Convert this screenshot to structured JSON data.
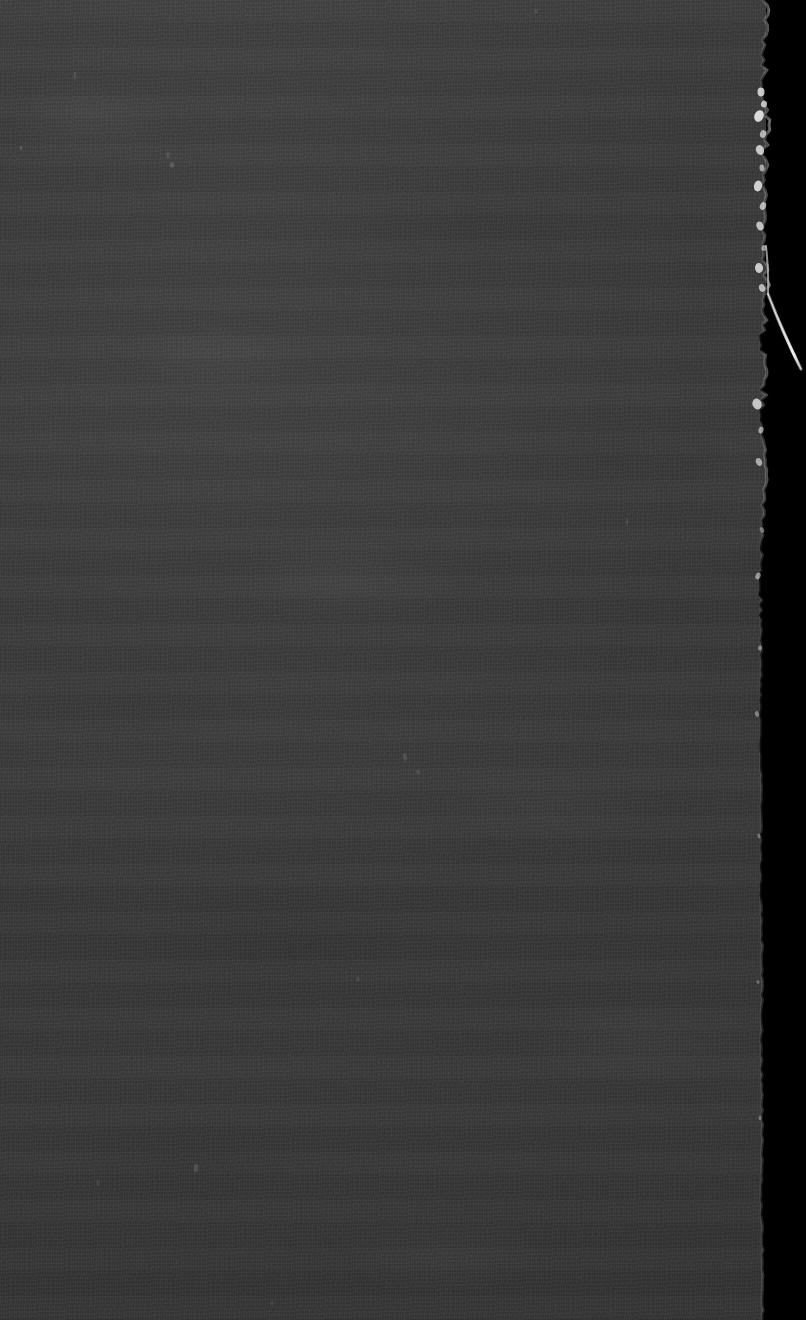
{
  "image": {
    "domain": "Natural-Image",
    "subject": "torn-fibrous-edge-macro",
    "description": "Extreme close-up macro photograph of a dark gray fibrous sheet material (paper or board) whose right-hand torn edge is silhouetted against a black background. A single pale fiber strand protrudes diagonally out from the edge near the upper third of the frame.",
    "width_px": 806,
    "height_px": 1320,
    "orientation": "portrait",
    "lighting": "low-key, flat frontal illumination; edge highlights only",
    "focus": "shallow, edge in focus",
    "text_present": "none"
  },
  "colors": {
    "background_black": "#000000",
    "material_gray": "#3a3a3a",
    "material_gray_light": "#3d3d3d",
    "material_gray_dark": "#373737",
    "edge_highlight": "#b9b9b9",
    "fiber_bright": "#e8e8e8",
    "fiber_mid": "#9a9a9a",
    "fleck_white": "#f0f0f0"
  },
  "regions": [
    {
      "name": "material-slab",
      "role": "primary subject",
      "bounds": {
        "x": 0,
        "y": 0,
        "width": 766,
        "height": 1320
      },
      "tone": "#3a3a3a",
      "texture": "fine fibrous grain with faint horizontal scanline banding and soft mottling"
    },
    {
      "name": "black-background",
      "role": "negative space",
      "bounds": {
        "x": 760,
        "y": 0,
        "width": 46,
        "height": 1320
      },
      "tone": "#000000"
    },
    {
      "name": "torn-edge",
      "role": "boundary",
      "approx_x_top": 765,
      "approx_x_middle": 760,
      "approx_x_bottom": 762,
      "character": "ragged, flecked with bright fiber tufts in the upper third; becomes clean and nearly straight below y=600"
    },
    {
      "name": "protruding-fiber",
      "role": "detail",
      "origin": {
        "x": 768,
        "y": 294
      },
      "tip": {
        "x": 801,
        "y": 369
      },
      "description": "single pale tapered fiber angling down and to the right, brightest near its tip"
    },
    {
      "name": "edge-fleck-cluster",
      "role": "detail",
      "bounds": {
        "x": 758,
        "y": 86,
        "width": 16,
        "height": 120
      },
      "description": "cluster of bright irregular fiber tufts along the edge"
    }
  ],
  "edge_profile": {
    "note": "x position of the material/background boundary sampled down the frame",
    "points": [
      {
        "y": 0,
        "x": 766
      },
      {
        "y": 40,
        "x": 765
      },
      {
        "y": 90,
        "x": 763
      },
      {
        "y": 120,
        "x": 768
      },
      {
        "y": 150,
        "x": 764
      },
      {
        "y": 200,
        "x": 766
      },
      {
        "y": 240,
        "x": 763
      },
      {
        "y": 280,
        "x": 767
      },
      {
        "y": 300,
        "x": 765
      },
      {
        "y": 340,
        "x": 762
      },
      {
        "y": 380,
        "x": 764
      },
      {
        "y": 420,
        "x": 761
      },
      {
        "y": 470,
        "x": 766
      },
      {
        "y": 520,
        "x": 762
      },
      {
        "y": 580,
        "x": 760
      },
      {
        "y": 650,
        "x": 761
      },
      {
        "y": 720,
        "x": 760
      },
      {
        "y": 800,
        "x": 761
      },
      {
        "y": 880,
        "x": 760
      },
      {
        "y": 960,
        "x": 762
      },
      {
        "y": 1040,
        "x": 761
      },
      {
        "y": 1120,
        "x": 762
      },
      {
        "y": 1200,
        "x": 761
      },
      {
        "y": 1280,
        "x": 763
      },
      {
        "y": 1320,
        "x": 762
      }
    ]
  },
  "flecks": [
    {
      "x": 761,
      "y": 92,
      "w": 7,
      "h": 9,
      "bright": 0.8
    },
    {
      "x": 764,
      "y": 104,
      "w": 6,
      "h": 7,
      "bright": 0.72
    },
    {
      "x": 759,
      "y": 116,
      "w": 9,
      "h": 12,
      "bright": 0.88
    },
    {
      "x": 763,
      "y": 134,
      "w": 6,
      "h": 8,
      "bright": 0.66
    },
    {
      "x": 760,
      "y": 150,
      "w": 8,
      "h": 10,
      "bright": 0.78
    },
    {
      "x": 762,
      "y": 168,
      "w": 5,
      "h": 7,
      "bright": 0.6
    },
    {
      "x": 758,
      "y": 186,
      "w": 8,
      "h": 11,
      "bright": 0.82
    },
    {
      "x": 763,
      "y": 206,
      "w": 6,
      "h": 8,
      "bright": 0.68
    },
    {
      "x": 760,
      "y": 226,
      "w": 7,
      "h": 9,
      "bright": 0.74
    },
    {
      "x": 764,
      "y": 248,
      "w": 5,
      "h": 6,
      "bright": 0.56
    },
    {
      "x": 759,
      "y": 268,
      "w": 8,
      "h": 10,
      "bright": 0.8
    },
    {
      "x": 762,
      "y": 288,
      "w": 6,
      "h": 8,
      "bright": 0.7
    },
    {
      "x": 757,
      "y": 404,
      "w": 9,
      "h": 11,
      "bright": 0.76
    },
    {
      "x": 761,
      "y": 430,
      "w": 5,
      "h": 7,
      "bright": 0.58
    },
    {
      "x": 759,
      "y": 462,
      "w": 6,
      "h": 8,
      "bright": 0.62
    },
    {
      "x": 762,
      "y": 530,
      "w": 4,
      "h": 6,
      "bright": 0.48
    },
    {
      "x": 758,
      "y": 576,
      "w": 5,
      "h": 7,
      "bright": 0.54
    },
    {
      "x": 760,
      "y": 648,
      "w": 4,
      "h": 5,
      "bright": 0.42
    },
    {
      "x": 757,
      "y": 714,
      "w": 4,
      "h": 6,
      "bright": 0.4
    },
    {
      "x": 759,
      "y": 836,
      "w": 3,
      "h": 5,
      "bright": 0.34
    },
    {
      "x": 758,
      "y": 982,
      "w": 3,
      "h": 4,
      "bright": 0.3
    },
    {
      "x": 760,
      "y": 1118,
      "w": 3,
      "h": 5,
      "bright": 0.32
    }
  ],
  "surface_specks": [
    {
      "x": 21,
      "y": 148,
      "bright": 0.3
    },
    {
      "x": 168,
      "y": 155,
      "bright": 0.26
    },
    {
      "x": 75,
      "y": 76,
      "bright": 0.22
    },
    {
      "x": 172,
      "y": 165,
      "bright": 0.34
    },
    {
      "x": 405,
      "y": 757,
      "bright": 0.24
    },
    {
      "x": 418,
      "y": 772,
      "bright": 0.2
    },
    {
      "x": 358,
      "y": 979,
      "bright": 0.22
    },
    {
      "x": 196,
      "y": 1168,
      "bright": 0.28
    },
    {
      "x": 98,
      "y": 1183,
      "bright": 0.2
    },
    {
      "x": 272,
      "y": 1303,
      "bright": 0.18
    },
    {
      "x": 536,
      "y": 11,
      "bright": 0.2
    },
    {
      "x": 627,
      "y": 522,
      "bright": 0.18
    }
  ]
}
